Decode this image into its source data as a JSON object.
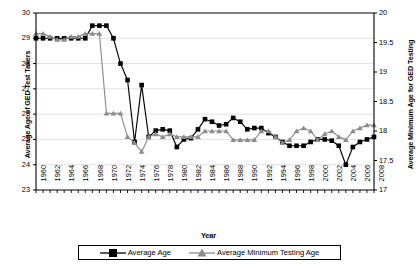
{
  "chart_data": {
    "type": "line",
    "title": "",
    "xlabel": "Year",
    "ylabel": "Average Age of GED Test Takers",
    "ylabel_secondary": "Average Minimum Age for GED Testing",
    "xlim": [
      1960,
      2008
    ],
    "ylim": [
      23,
      30
    ],
    "ylim_secondary": [
      17,
      20
    ],
    "yticks": [
      23,
      24,
      25,
      26,
      27,
      28,
      29,
      30
    ],
    "yticks_secondary": [
      17,
      17.5,
      18,
      18.5,
      19,
      19.5,
      20
    ],
    "xticks": [
      1960,
      1962,
      1964,
      1966,
      1968,
      1970,
      1972,
      1974,
      1976,
      1978,
      1980,
      1982,
      1984,
      1986,
      1988,
      1990,
      1992,
      1994,
      1996,
      1998,
      2000,
      2002,
      2004,
      2006,
      2008
    ],
    "grid": true,
    "legend_position": "bottom",
    "x": [
      1960,
      1961,
      1962,
      1963,
      1964,
      1965,
      1966,
      1967,
      1968,
      1969,
      1970,
      1971,
      1972,
      1973,
      1974,
      1975,
      1976,
      1977,
      1978,
      1979,
      1980,
      1981,
      1982,
      1983,
      1984,
      1985,
      1986,
      1987,
      1988,
      1989,
      1990,
      1991,
      1992,
      1993,
      1994,
      1995,
      1996,
      1997,
      1998,
      1999,
      2000,
      2001,
      2002,
      2003,
      2004,
      2005,
      2006,
      2007,
      2008
    ],
    "series": [
      {
        "name": "Average Age",
        "axis": "left",
        "color": "#000000",
        "marker": "square",
        "values": [
          29.0,
          29.0,
          29.0,
          29.0,
          29.0,
          29.0,
          29.0,
          29.0,
          29.5,
          29.5,
          29.5,
          29.0,
          28.0,
          27.35,
          24.9,
          27.15,
          25.1,
          25.35,
          25.4,
          25.35,
          24.7,
          25.0,
          25.05,
          25.4,
          25.8,
          25.7,
          25.55,
          25.6,
          25.85,
          25.7,
          25.4,
          25.45,
          25.45,
          25.25,
          25.1,
          24.9,
          24.75,
          24.75,
          24.75,
          24.9,
          25.0,
          25.0,
          24.95,
          24.75,
          24.0,
          24.7,
          24.9,
          25.0,
          25.1
        ]
      },
      {
        "name": "Average Minimum Testing Age",
        "axis": "right",
        "color": "#8c8c8c",
        "marker": "triangle",
        "values": [
          19.65,
          19.65,
          19.6,
          19.55,
          19.55,
          19.6,
          19.6,
          19.65,
          19.65,
          19.65,
          18.3,
          18.3,
          18.3,
          17.9,
          17.8,
          17.65,
          17.9,
          17.95,
          17.9,
          17.95,
          17.9,
          17.9,
          17.9,
          17.9,
          18.0,
          18.0,
          18.0,
          18.0,
          17.85,
          17.85,
          17.85,
          17.85,
          18.0,
          18.0,
          17.9,
          17.8,
          17.85,
          18.0,
          18.05,
          18.0,
          17.85,
          17.95,
          18.0,
          17.9,
          17.85,
          18.0,
          18.05,
          18.1,
          18.1
        ]
      }
    ]
  },
  "axes": {
    "left_title": "Average Age of GED Test Takers",
    "right_title": "Average Minimum Age for GED Testing",
    "x_title": "Year"
  },
  "legend": {
    "items": [
      {
        "label": "Average Age"
      },
      {
        "label": "Average Minimum Testing Age"
      }
    ]
  },
  "colors": {
    "series_primary": "#000000",
    "series_secondary": "#8c8c8c",
    "grid": "#d9d9d9",
    "axis": "#000000"
  }
}
